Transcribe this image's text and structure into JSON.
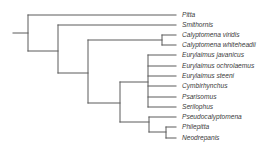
{
  "diagram": {
    "type": "phylogenetic-tree",
    "line_color": "#5a5a5a",
    "label_color": "#3a3a3a",
    "taxa": [
      {
        "name": "Pitta",
        "y": 15
      },
      {
        "name": "Smithornis",
        "y": 25
      },
      {
        "name": "Calyptomena viridis",
        "y": 35
      },
      {
        "name": "Calyptomena whiteheadii",
        "y": 45
      },
      {
        "name": "Eurylaimus javanicus",
        "y": 55
      },
      {
        "name": "Eurylaimus ochrolaemus",
        "y": 66
      },
      {
        "name": "Eurylaimus steeni",
        "y": 76
      },
      {
        "name": "Cymbirhynchus",
        "y": 86
      },
      {
        "name": "Psarisomus",
        "y": 97
      },
      {
        "name": "Serilophus",
        "y": 107
      },
      {
        "name": "Pseudocalyptomena",
        "y": 117
      },
      {
        "name": "Philepitta",
        "y": 127
      },
      {
        "name": "Neodrepanis",
        "y": 138
      }
    ],
    "newick": "(Pitta,(Smithornis,((Calyptomena viridis,Calyptomena whiteheadii),((Eurylaimus javanicus,Eurylaimus ochrolaemus,Eurylaimus steeni,Cymbirhynchus,Psarisomus,Serilophus),(Pseudocalyptomena,(Philepitta,Neodrepanis))))));",
    "leaf_end_x": 176,
    "label_x": 182,
    "segments": [
      {
        "id": "root-stem",
        "x1": 13,
        "y1": 33,
        "x2": 28,
        "y2": 33
      },
      {
        "id": "root-vertical",
        "x1": 28,
        "y1": 15,
        "x2": 28,
        "y2": 51
      },
      {
        "id": "to-pitta",
        "x1": 28,
        "y1": 15,
        "x2": 176,
        "y2": 15
      },
      {
        "id": "to-nodeA",
        "x1": 28,
        "y1": 51,
        "x2": 58,
        "y2": 51
      },
      {
        "id": "nodeA-vertical",
        "x1": 58,
        "y1": 25,
        "x2": 58,
        "y2": 73
      },
      {
        "id": "to-smithornis",
        "x1": 58,
        "y1": 25,
        "x2": 176,
        "y2": 25
      },
      {
        "id": "to-nodeB",
        "x1": 58,
        "y1": 73,
        "x2": 88,
        "y2": 73
      },
      {
        "id": "nodeB-vertical",
        "x1": 88,
        "y1": 40,
        "x2": 88,
        "y2": 103
      },
      {
        "id": "to-calyptomena",
        "x1": 88,
        "y1": 40,
        "x2": 162,
        "y2": 40
      },
      {
        "id": "calyptomena-vertical",
        "x1": 162,
        "y1": 35,
        "x2": 162,
        "y2": 45
      },
      {
        "id": "to-c-viridis",
        "x1": 162,
        "y1": 35,
        "x2": 176,
        "y2": 35
      },
      {
        "id": "to-c-whiteheadii",
        "x1": 162,
        "y1": 45,
        "x2": 176,
        "y2": 45
      },
      {
        "id": "to-nodeC",
        "x1": 88,
        "y1": 103,
        "x2": 120,
        "y2": 103
      },
      {
        "id": "nodeC-vertical",
        "x1": 120,
        "y1": 82,
        "x2": 120,
        "y2": 122
      },
      {
        "id": "to-eurylaimus-group",
        "x1": 120,
        "y1": 82,
        "x2": 148,
        "y2": 82
      },
      {
        "id": "eurylaimus-vertical",
        "x1": 148,
        "y1": 55,
        "x2": 148,
        "y2": 107
      },
      {
        "id": "to-e-javanicus",
        "x1": 148,
        "y1": 55,
        "x2": 176,
        "y2": 55
      },
      {
        "id": "to-e-ochrolaemus",
        "x1": 148,
        "y1": 66,
        "x2": 176,
        "y2": 66
      },
      {
        "id": "to-e-steeni",
        "x1": 148,
        "y1": 76,
        "x2": 176,
        "y2": 76
      },
      {
        "id": "to-cymbirhynchus",
        "x1": 148,
        "y1": 86,
        "x2": 176,
        "y2": 86
      },
      {
        "id": "to-psarisomus",
        "x1": 148,
        "y1": 97,
        "x2": 176,
        "y2": 97
      },
      {
        "id": "to-serilophus",
        "x1": 148,
        "y1": 107,
        "x2": 176,
        "y2": 107
      },
      {
        "id": "to-pseudo-group",
        "x1": 120,
        "y1": 122,
        "x2": 149,
        "y2": 122
      },
      {
        "id": "pseudo-vertical",
        "x1": 149,
        "y1": 117,
        "x2": 149,
        "y2": 132
      },
      {
        "id": "to-pseudocalyptomena",
        "x1": 149,
        "y1": 117,
        "x2": 176,
        "y2": 117
      },
      {
        "id": "to-phil-node",
        "x1": 149,
        "y1": 132,
        "x2": 166,
        "y2": 132
      },
      {
        "id": "phil-vertical",
        "x1": 166,
        "y1": 127,
        "x2": 166,
        "y2": 138
      },
      {
        "id": "to-philepitta",
        "x1": 166,
        "y1": 127,
        "x2": 176,
        "y2": 127
      },
      {
        "id": "to-neodrepanis",
        "x1": 166,
        "y1": 138,
        "x2": 176,
        "y2": 138
      }
    ]
  }
}
